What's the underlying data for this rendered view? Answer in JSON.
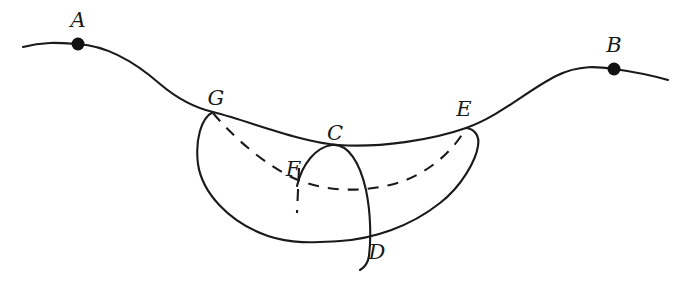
{
  "figure": {
    "type": "line-diagram",
    "title": "",
    "background_color": "#ffffff",
    "stroke_color": "#1a1a1a",
    "width": 690,
    "height": 289
  },
  "labels": {
    "A": "A",
    "B": "B",
    "C": "C",
    "D": "D",
    "E": "E",
    "F": "F",
    "G": "G"
  },
  "points": [
    {
      "id": "A",
      "label": "A",
      "x": 78,
      "y": 44,
      "label_x": 78,
      "label_y": 21,
      "marked": true
    },
    {
      "id": "B",
      "label": "B",
      "x": 614,
      "y": 69,
      "label_x": 614,
      "label_y": 46,
      "marked": true
    },
    {
      "id": "G",
      "label": "G",
      "x": 213,
      "y": 112,
      "label_x": 215,
      "label_y": 99,
      "marked": false
    },
    {
      "id": "C",
      "label": "C",
      "x": 338,
      "y": 146,
      "label_x": 334,
      "label_y": 135,
      "marked": false
    },
    {
      "id": "E",
      "label": "E",
      "x": 466,
      "y": 128,
      "label_x": 463,
      "label_y": 110,
      "marked": false
    },
    {
      "id": "F",
      "label": "F",
      "x": 300,
      "y": 182,
      "label_x": 293,
      "label_y": 170,
      "marked": false
    },
    {
      "id": "D",
      "label": "D",
      "x": 366,
      "y": 242,
      "label_x": 376,
      "label_y": 253,
      "marked": false
    }
  ],
  "curves": [
    {
      "id": "main-sinusoid",
      "name": "main-curve",
      "style": "solid",
      "description": "Long S-shaped curve passing through A, G, C, E, B"
    },
    {
      "id": "crescent-left",
      "name": "crescent-left-edge",
      "style": "solid",
      "description": "Left lower boundary of the lens region from G bulging left and down"
    },
    {
      "id": "crescent-bottom",
      "name": "crescent-bottom-edge",
      "style": "solid",
      "description": "Lower boundary of the lens region curving to E"
    },
    {
      "id": "hidden-arc",
      "name": "hidden-dashed-arc",
      "style": "dashed",
      "description": "Dashed back arc from G through F to E"
    },
    {
      "id": "cd-arc",
      "name": "cd-arc",
      "style": "solid",
      "description": "Arc rising from near F to apex at C then descending through D"
    },
    {
      "id": "f-tick",
      "name": "f-tick-mark",
      "style": "dashed",
      "description": "Short vertical dashed tick through F"
    }
  ],
  "dot_radius": 6
}
